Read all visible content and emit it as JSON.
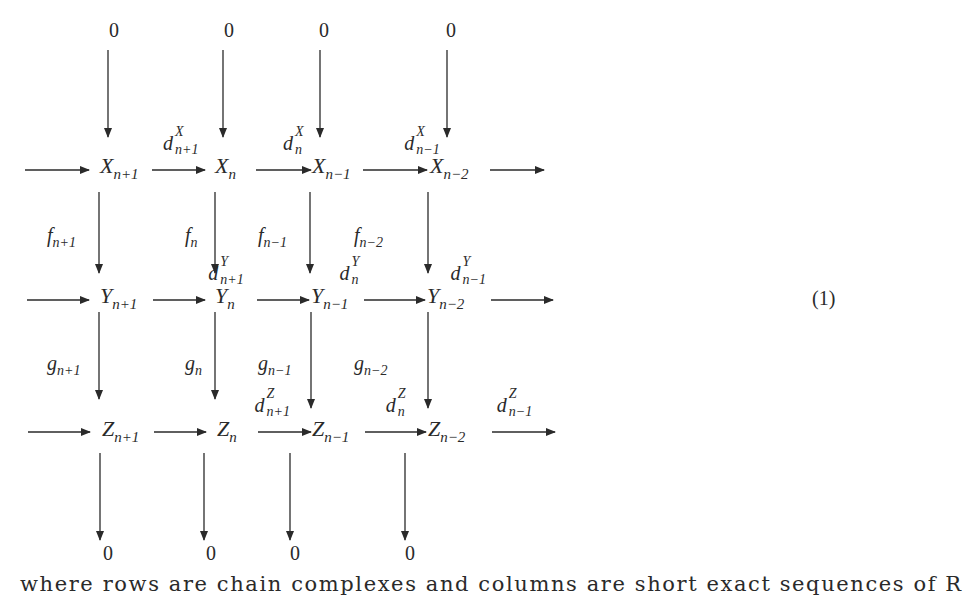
{
  "diagram": {
    "rows": [
      {
        "name": "X",
        "objects": [
          "X",
          "X",
          "X",
          "X"
        ],
        "subs": [
          "n+1",
          "n",
          "n−1",
          "n−2"
        ],
        "differentials": [
          {
            "base": "d",
            "sup": "X",
            "sub": "n+1"
          },
          {
            "base": "d",
            "sup": "X",
            "sub": "n"
          },
          {
            "base": "d",
            "sup": "X",
            "sub": "n−1"
          }
        ]
      },
      {
        "name": "Y",
        "objects": [
          "Y",
          "Y",
          "Y",
          "Y"
        ],
        "subs": [
          "n+1",
          "n",
          "n−1",
          "n−2"
        ],
        "differentials": [
          {
            "base": "d",
            "sup": "Y",
            "sub": "n+1"
          },
          {
            "base": "d",
            "sup": "Y",
            "sub": "n"
          },
          {
            "base": "d",
            "sup": "Y",
            "sub": "n−1"
          }
        ]
      },
      {
        "name": "Z",
        "objects": [
          "Z",
          "Z",
          "Z",
          "Z"
        ],
        "subs": [
          "n+1",
          "n",
          "n−1",
          "n−2"
        ],
        "differentials": [
          {
            "base": "d",
            "sup": "Z",
            "sub": "n+1"
          },
          {
            "base": "d",
            "sup": "Z",
            "sub": "n"
          },
          {
            "base": "d",
            "sup": "Z",
            "sub": "n−1"
          }
        ]
      }
    ],
    "vertical_maps": {
      "f": [
        {
          "base": "f",
          "sub": "n+1"
        },
        {
          "base": "f",
          "sub": "n"
        },
        {
          "base": "f",
          "sub": "n−1"
        },
        {
          "base": "f",
          "sub": "n−2"
        }
      ],
      "g": [
        {
          "base": "g",
          "sub": "n+1"
        },
        {
          "base": "g",
          "sub": "n"
        },
        {
          "base": "g",
          "sub": "n−1"
        },
        {
          "base": "g",
          "sub": "n−2"
        }
      ]
    },
    "top_zeros": [
      "0",
      "0",
      "0",
      "0"
    ],
    "bottom_zeros": [
      "0",
      "0",
      "0",
      "0"
    ],
    "equation_number": "(1)"
  },
  "caption": "where rows are chain complexes and columns are short exact sequences of R"
}
